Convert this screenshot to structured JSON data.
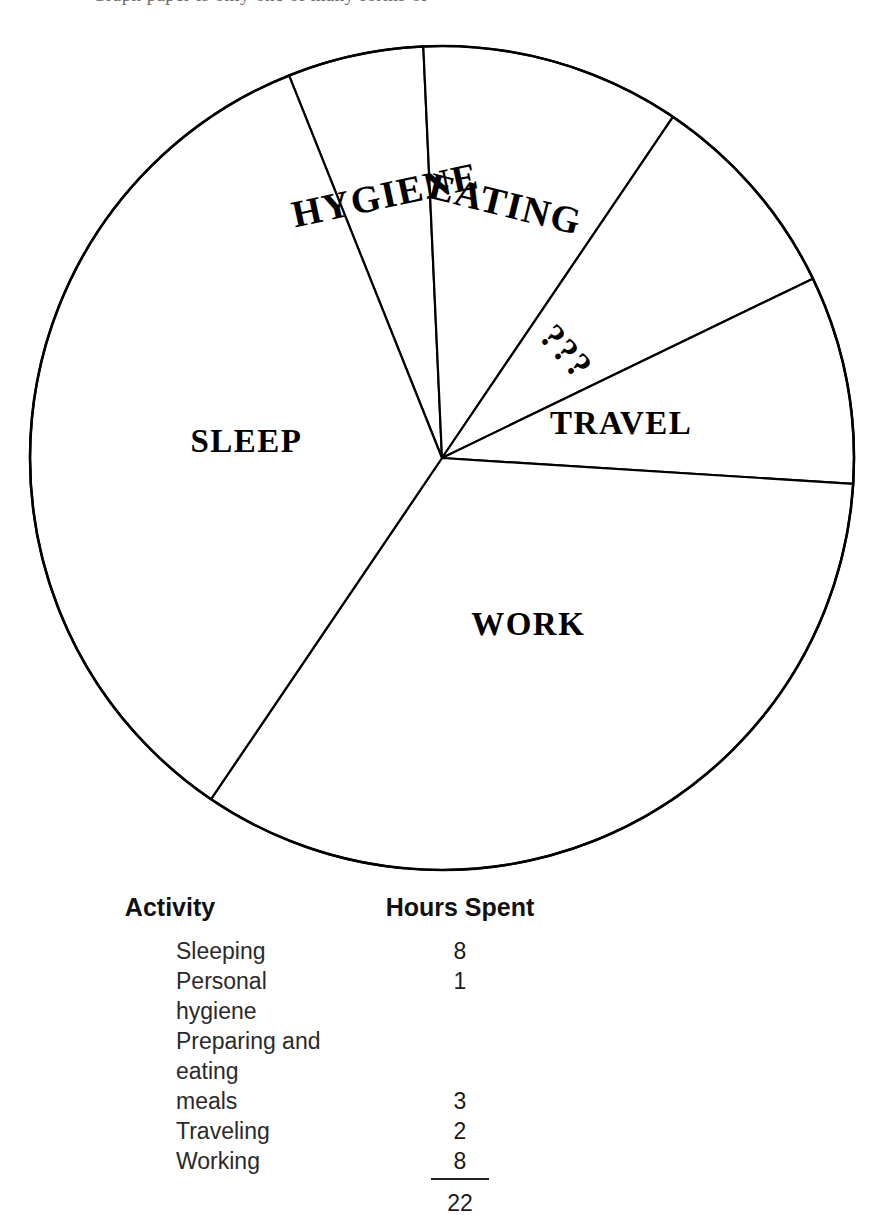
{
  "page": {
    "top_cutoff_caption": "Graph paper is only one of many forms of"
  },
  "chart_data": {
    "type": "pie",
    "title": "",
    "center": {
      "x": 442,
      "y": 458
    },
    "radius": 412,
    "total_hours": 22,
    "unit": "hours",
    "legend_position": "on-slice",
    "grid": false,
    "categories": [
      "HYGIENE",
      "EATING",
      "???",
      "TRAVEL",
      "WORK",
      "SLEEP"
    ],
    "values": [
      1,
      3,
      1,
      2,
      8,
      8
    ],
    "slices": [
      {
        "label": "HYGIENE",
        "value": 1,
        "start_angle": -21.8,
        "end_angle": -2.6,
        "label_angle": -12.2,
        "label_radius": 265,
        "label_rotation": -12.2,
        "label_font_size": 38
      },
      {
        "label": "EATING",
        "value": 3,
        "start_angle": -2.6,
        "end_angle": 34.1,
        "label_angle": 14.0,
        "label_radius": 258,
        "label_rotation": 14.0,
        "label_font_size": 38
      },
      {
        "label": "???",
        "value": 1,
        "start_angle": 34.1,
        "end_angle": 64.2,
        "label_angle": 49.5,
        "label_radius": 160,
        "label_rotation": 48.0,
        "label_font_size": 36
      },
      {
        "label": "TRAVEL",
        "value": 2,
        "start_angle": 64.2,
        "end_angle": 93.6,
        "label_angle": 80.0,
        "label_radius": 182,
        "label_rotation": 0,
        "label_font_size": 33
      },
      {
        "label": "WORK",
        "value": 8,
        "start_angle": 93.6,
        "end_angle": 214.1,
        "label_angle": 153.0,
        "label_radius": 190,
        "label_rotation": 0,
        "label_font_size": 33
      },
      {
        "label": "SLEEP",
        "value": 8,
        "start_angle": 214.1,
        "end_angle": 338.2,
        "label_angle": 274.0,
        "label_radius": 196,
        "label_rotation": 0,
        "label_font_size": 33
      }
    ],
    "stroke_color": "#000000",
    "fill_color": "#ffffff"
  },
  "table": {
    "headers": {
      "activity": "Activity",
      "hours": "Hours Spent"
    },
    "rows": [
      {
        "activity": "Sleeping",
        "hours": "8"
      },
      {
        "activity": "Personal hygiene",
        "hours": "1"
      },
      {
        "activity": "Preparing and eating",
        "hours": ""
      },
      {
        "activity": "meals",
        "hours": "3"
      },
      {
        "activity": "Traveling",
        "hours": "2"
      },
      {
        "activity": "Working",
        "hours": "8"
      }
    ],
    "total": "22"
  }
}
